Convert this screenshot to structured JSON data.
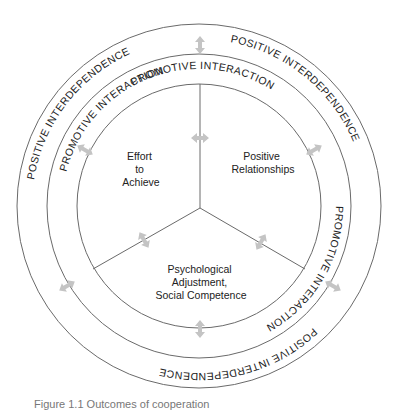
{
  "diagram": {
    "outer_ring_label": "POSITIVE INTERDEPENDENCE",
    "inner_ring_label": "PROMOTIVE INTERACTION",
    "outcomes": {
      "effort": {
        "lines": [
          "Effort",
          "to",
          "Achieve"
        ]
      },
      "relationships": {
        "lines": [
          "Positive",
          "Relationships"
        ]
      },
      "psychological": {
        "lines": [
          "Psychological",
          "Adjustment,",
          "Social Competence"
        ]
      }
    },
    "colors": {
      "ring_stroke": "#6a6a6a",
      "arrow_fill": "#c4c4c4",
      "text": "#222222"
    }
  },
  "caption": {
    "text": "Figure 1.1   Outcomes of cooperation"
  }
}
